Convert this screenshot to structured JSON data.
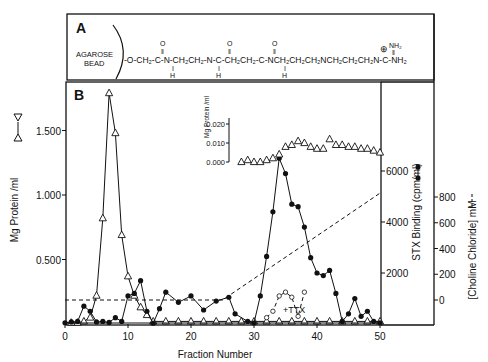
{
  "panel_a": {
    "label": "A",
    "bead_label_1": "AGAROSE",
    "bead_label_2": "BEAD",
    "formula": "-O-CH2-C(=O)-NH-CH2CH2-NH-C(=O)-CH2CH2-C(=O)-NH-CH2CH2CH2NHCH2CH2CH2N-C(=NH2+)-NH2",
    "segments": [
      "-O-CH",
      "2",
      "-C-N-CH",
      "2",
      "CH",
      "2",
      "-N-C-CH",
      "2",
      "CH",
      "2",
      "-C-NCH",
      "2",
      "CH",
      "2",
      "CH",
      "2",
      "NCH",
      "2",
      "CH",
      "2",
      "CH",
      "2",
      "N-C-NH",
      "2"
    ],
    "charge": "⊕",
    "nh2_top": "NH2"
  },
  "panel_b": {
    "label": "B",
    "inset_ylabel": "Mg Protein /ml",
    "ttx_label": "+TTX"
  },
  "chart_data": {
    "type": "line",
    "title": "",
    "xlabel": "Fraction Number",
    "xlim": [
      0,
      50
    ],
    "xticks": [
      0,
      10,
      20,
      30,
      40,
      50
    ],
    "axes": {
      "left": {
        "label": "Mg Protein /ml",
        "ticks": [
          "0.500",
          "1.000",
          "1.500"
        ],
        "range": [
          0,
          1.8
        ]
      },
      "right1": {
        "label": "STX Binding (cpm/ml)",
        "ticks": [
          "2000",
          "4000",
          "6000"
        ],
        "range": [
          0,
          6500
        ]
      },
      "right2": {
        "label": "[Choline Chloride] mM",
        "ticks": [
          "0",
          "200",
          "400",
          "600",
          "800"
        ],
        "range": [
          -180,
          900
        ]
      }
    },
    "series": [
      {
        "name": "Protein (open triangles)",
        "axis": "left",
        "marker": "open-triangle",
        "line": "solid",
        "x": [
          1,
          2,
          3,
          4,
          5,
          6,
          7,
          8,
          9,
          10,
          11,
          12,
          13,
          14,
          16,
          18,
          20,
          22,
          24,
          26,
          28,
          30,
          32,
          34,
          36,
          38,
          40,
          42,
          44,
          46,
          48,
          50
        ],
        "y": [
          0.01,
          0.01,
          0.02,
          0.05,
          0.22,
          0.82,
          1.79,
          1.48,
          0.69,
          0.37,
          0.22,
          0.13,
          0.07,
          0.02,
          0.02,
          0.02,
          0.02,
          0.02,
          0.02,
          0.02,
          0.02,
          0.02,
          0.02,
          0.02,
          0.02,
          0.02,
          0.02,
          0.02,
          0.02,
          0.02,
          0.02,
          0.02
        ]
      },
      {
        "name": "STX Binding (filled circles)",
        "axis": "right1",
        "marker": "filled-circle",
        "line": "solid",
        "x": [
          0,
          1,
          2,
          3,
          4,
          5,
          6,
          7,
          8,
          9,
          10,
          11,
          12,
          13,
          14,
          15,
          16,
          18,
          20,
          22,
          24,
          26,
          27,
          29,
          30,
          31,
          32,
          33,
          34,
          35,
          36,
          37,
          38,
          39,
          40,
          41,
          42,
          43,
          44,
          45,
          46,
          47,
          48,
          49,
          50
        ],
        "y": [
          50,
          80,
          100,
          700,
          500,
          80,
          100,
          60,
          250,
          100,
          1100,
          1200,
          1700,
          500,
          30,
          600,
          1250,
          850,
          1100,
          550,
          900,
          1050,
          400,
          100,
          40,
          1100,
          2650,
          4400,
          6500,
          5900,
          4700,
          4600,
          3800,
          2600,
          2000,
          1900,
          2100,
          1200,
          100,
          400,
          1000,
          300,
          500,
          100,
          50
        ]
      },
      {
        "name": "Protein inset (open triangles, 0-0.020 scale)",
        "axis": "inset",
        "marker": "open-triangle",
        "line": "none",
        "x": [
          28,
          29,
          30,
          31,
          32,
          33,
          34,
          35,
          36,
          37,
          38,
          39,
          40,
          41,
          42,
          43,
          44,
          45,
          46,
          47,
          48,
          49,
          50
        ],
        "y": [
          0.0,
          0.001,
          0.0,
          0.0,
          0.001,
          0.002,
          0.004,
          0.008,
          0.009,
          0.011,
          0.01,
          0.008,
          0.007,
          0.007,
          0.012,
          0.009,
          0.009,
          0.008,
          0.008,
          0.007,
          0.007,
          0.006,
          0.005
        ]
      },
      {
        "name": "+TTX (open circles)",
        "axis": "right1",
        "marker": "open-circle",
        "line": "dashed",
        "x": [
          32,
          33,
          34,
          35,
          36,
          37,
          38
        ],
        "y": [
          250,
          500,
          1100,
          1250,
          1050,
          300,
          1250
        ]
      },
      {
        "name": "Choline Chloride gradient",
        "axis": "right2",
        "marker": "none",
        "line": "dashed",
        "x": [
          0,
          25,
          50
        ],
        "y": [
          0,
          0,
          830
        ]
      }
    ],
    "inset": {
      "ylabel": "Mg Protein /ml",
      "ticks": [
        "0.000",
        "0.010",
        "0.020"
      ],
      "range": [
        0,
        0.02
      ]
    },
    "annotations": [
      "+TTX"
    ],
    "grid": false,
    "legend": "none (axis labels show marker symbols)"
  }
}
